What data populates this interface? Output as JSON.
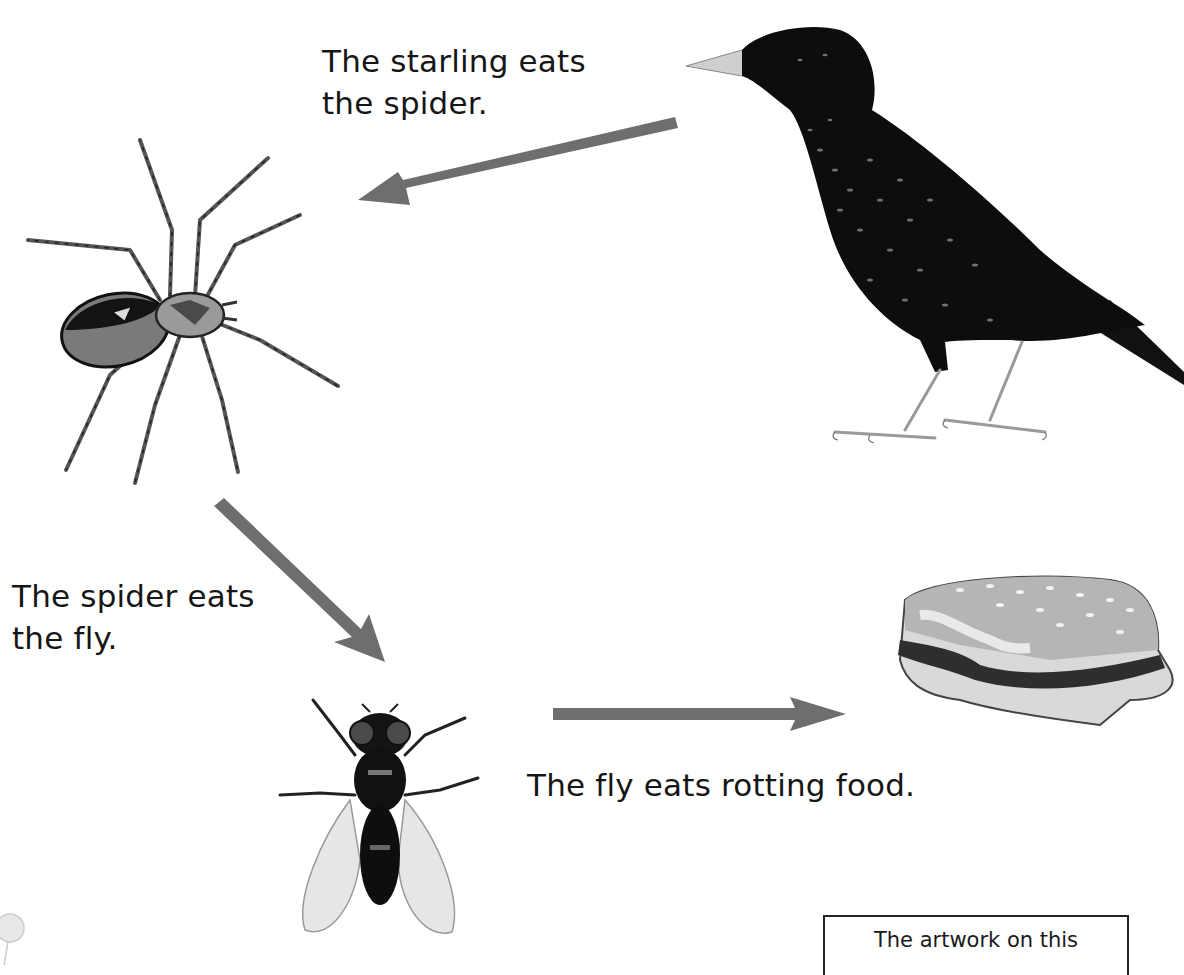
{
  "diagram": {
    "labels": {
      "starling_eats_spider": [
        "The starling eats",
        "the spider."
      ],
      "spider_eats_fly": [
        "The spider eats",
        "the fly."
      ],
      "fly_eats_food": "The fly eats rotting food."
    },
    "nodes": [
      {
        "id": "starling",
        "name": "Starling"
      },
      {
        "id": "spider",
        "name": "Spider"
      },
      {
        "id": "fly",
        "name": "Fly"
      },
      {
        "id": "rotting-food",
        "name": "Rotting food (half-eaten burger)"
      }
    ],
    "edges": [
      {
        "from": "starling",
        "to": "spider",
        "label": "The starling eats the spider."
      },
      {
        "from": "spider",
        "to": "fly",
        "label": "The spider eats the fly."
      },
      {
        "from": "fly",
        "to": "rotting-food",
        "label": "The fly eats rotting food."
      }
    ],
    "arrow_color": "#6e6e6e",
    "note": "The artwork on this"
  }
}
